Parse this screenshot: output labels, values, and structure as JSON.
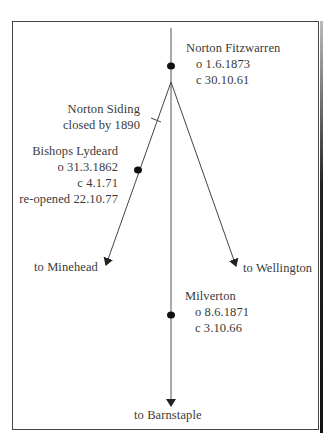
{
  "diagram": {
    "type": "railway-junction",
    "stations": [
      {
        "name": "Norton Fitzwarren",
        "lines": [
          "o 1.6.1873",
          "c 30.10.61"
        ]
      },
      {
        "name": "Norton Siding",
        "lines": [
          "closed by 1890"
        ]
      },
      {
        "name": "Bishops Lydeard",
        "lines": [
          "o 31.3.1862",
          "c 4.1.71",
          "re-opened 22.10.77"
        ]
      },
      {
        "name": "Milverton",
        "lines": [
          "o 8.6.1871",
          "c 3.10.66"
        ]
      }
    ],
    "destinations": {
      "minehead": "to Minehead",
      "wellington": "to Wellington",
      "barnstaple": "to Barnstaple"
    },
    "colors": {
      "line": "#3a3a3a",
      "text": "#3a3a3a",
      "frame": "#444444"
    }
  }
}
